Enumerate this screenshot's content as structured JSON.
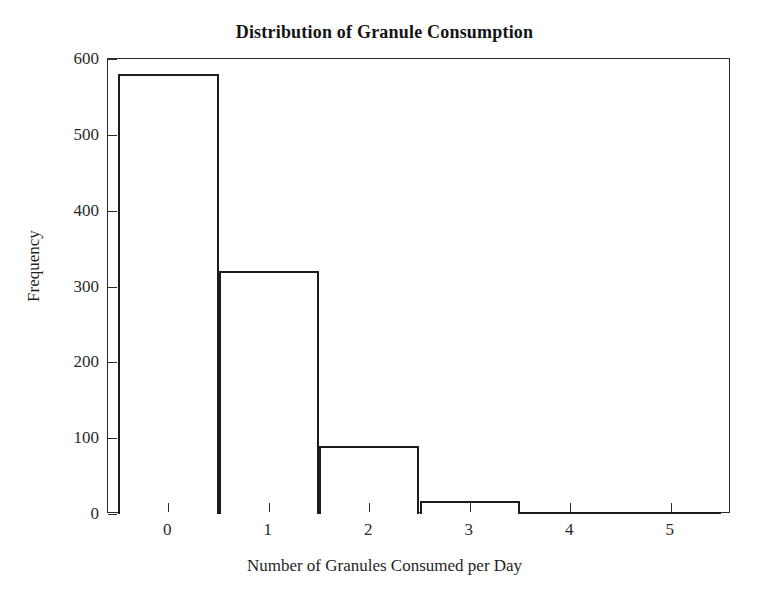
{
  "chart_data": {
    "type": "bar",
    "title": "Distribution of Granule Consumption",
    "xlabel": "Number of Granules Consumed per Day",
    "ylabel": "Frequency",
    "categories": [
      "0",
      "1",
      "2",
      "3",
      "4",
      "5"
    ],
    "values": [
      580,
      320,
      90,
      17,
      2,
      1
    ],
    "xlim": [
      -0.6,
      5.6
    ],
    "ylim": [
      0,
      600
    ],
    "xticks": [
      "0",
      "1",
      "2",
      "3",
      "4",
      "5"
    ],
    "yticks": [
      "0",
      "100",
      "200",
      "300",
      "400",
      "500",
      "600"
    ],
    "grid": false,
    "legend": false,
    "bar_width": 1,
    "bar_fill": "#ffffff",
    "bar_edge_color": "#1c1c1c",
    "axis_color": "#2b2b2b",
    "background": "#ffffff"
  },
  "figure": {
    "title": "Distribution of Granule Consumption",
    "xaxis_label": "Number of Granules Consumed per Day",
    "yaxis_label": "Frequency"
  }
}
